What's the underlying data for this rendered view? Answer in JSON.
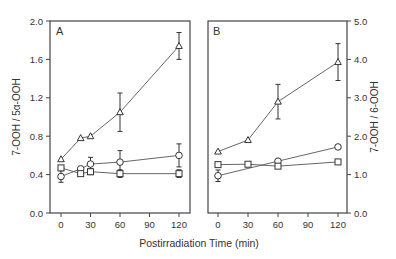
{
  "chart_data": [
    {
      "type": "line",
      "panel": "A",
      "xlabel": "Postirradiation Time (min)",
      "ylabel": "7-OOH / 5α-OOH",
      "xticks": [
        0,
        30,
        60,
        90,
        120
      ],
      "yticks": [
        "0.0",
        "0.4",
        "0.8",
        "1.2",
        "1.6",
        "2.0"
      ],
      "ylim": [
        0,
        2.0
      ],
      "xlim": [
        -7,
        128
      ],
      "grid": false,
      "legend": null,
      "series": [
        {
          "name": "triangle",
          "marker": "triangle",
          "x": [
            0,
            20,
            30,
            60,
            120
          ],
          "values": [
            0.56,
            0.78,
            0.8,
            1.05,
            1.74
          ],
          "err": [
            0,
            0,
            0,
            0.2,
            0.14
          ]
        },
        {
          "name": "circle",
          "marker": "circle",
          "x": [
            0,
            20,
            30,
            60,
            120
          ],
          "values": [
            0.38,
            0.46,
            0.51,
            0.53,
            0.6
          ],
          "err": [
            0.06,
            0,
            0.07,
            0.12,
            0.12
          ]
        },
        {
          "name": "square",
          "marker": "square",
          "x": [
            0,
            20,
            30,
            60,
            120
          ],
          "values": [
            0.47,
            0.41,
            0.43,
            0.41,
            0.41
          ],
          "err": [
            0,
            0,
            0.03,
            0.04,
            0.04
          ]
        }
      ]
    },
    {
      "type": "line",
      "panel": "B",
      "xlabel": "Postirradiation Time (min)",
      "ylabel": "7-OOH / 6-OOH",
      "xticks": [
        0,
        30,
        60,
        90,
        120
      ],
      "yticks": [
        "0.0",
        "1.0",
        "2.0",
        "3.0",
        "4.0",
        "5.0"
      ],
      "ylim": [
        0,
        5.0
      ],
      "xlim": [
        -7,
        128
      ],
      "grid": false,
      "legend": null,
      "series": [
        {
          "name": "triangle",
          "marker": "triangle",
          "x": [
            0,
            30,
            60,
            120
          ],
          "values": [
            1.6,
            1.9,
            2.9,
            3.93
          ],
          "err": [
            0,
            0,
            0.45,
            0.48
          ]
        },
        {
          "name": "circle",
          "marker": "circle",
          "x": [
            0,
            60,
            120
          ],
          "values": [
            0.97,
            1.35,
            1.72
          ],
          "err": [
            0.15,
            0,
            0
          ]
        },
        {
          "name": "square",
          "marker": "square",
          "x": [
            0,
            30,
            60,
            120
          ],
          "values": [
            1.26,
            1.27,
            1.22,
            1.33
          ],
          "err": [
            0,
            0,
            0,
            0
          ]
        }
      ]
    }
  ],
  "labels": {
    "panel_a": "A",
    "panel_b": "B",
    "xlabel": "Postirradiation Time (min)",
    "ylabel_left": "7-OOH / 5α-OOH",
    "ylabel_right": "7-OOH / 6-OOH"
  }
}
